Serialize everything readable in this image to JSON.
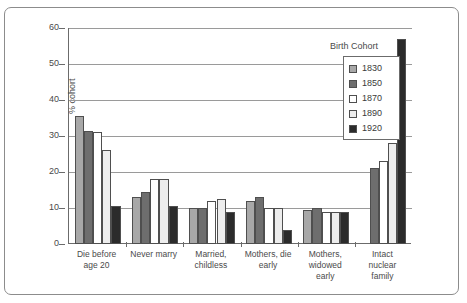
{
  "chart_data": {
    "type": "bar",
    "title": "",
    "xlabel": "",
    "ylabel": "% cohort",
    "ylim": [
      0,
      60
    ],
    "ytick_values": [
      0,
      10,
      20,
      30,
      40,
      50,
      60
    ],
    "ytick_labels": [
      "0",
      "10",
      "20",
      "30",
      "40",
      "50",
      "60"
    ],
    "grid": true,
    "legend_title": "Birth Cohort",
    "legend_position": "top-right-inside",
    "categories": [
      "Die before age 20",
      "Never marry",
      "Married, childless",
      "Mothers, die early",
      "Mothers, widowed early",
      "Intact nuclear family"
    ],
    "category_lines": [
      [
        "Die before",
        "age 20"
      ],
      [
        "Never marry"
      ],
      [
        "Married,",
        "childless"
      ],
      [
        "Mothers, die",
        "early"
      ],
      [
        "Mothers,",
        "widowed",
        "early"
      ],
      [
        "Intact",
        "nuclear",
        "family"
      ]
    ],
    "series": [
      {
        "name": "1830",
        "color": "#a8a8a8",
        "values": [
          35.5,
          13.0,
          10.0,
          12.0,
          9.5,
          null
        ]
      },
      {
        "name": "1850",
        "color": "#6e6e6e",
        "values": [
          31.5,
          14.5,
          10.0,
          13.0,
          10.0,
          21.0
        ]
      },
      {
        "name": "1870",
        "color": "#ffffff",
        "values": [
          31.0,
          18.0,
          12.0,
          10.0,
          9.0,
          23.0
        ]
      },
      {
        "name": "1890",
        "color": "#ededed",
        "values": [
          26.0,
          18.0,
          12.5,
          10.0,
          9.0,
          28.0
        ]
      },
      {
        "name": "1920",
        "color": "#2b2b2b",
        "values": [
          10.5,
          10.5,
          9.0,
          4.0,
          9.0,
          57.0
        ]
      }
    ]
  },
  "legend": {
    "title": "Birth Cohort",
    "entries": [
      {
        "label": "1830",
        "color": "#a8a8a8"
      },
      {
        "label": "1850",
        "color": "#6e6e6e"
      },
      {
        "label": "1870",
        "color": "#ffffff"
      },
      {
        "label": "1890",
        "color": "#ededed"
      },
      {
        "label": "1920",
        "color": "#2b2b2b"
      }
    ]
  },
  "axis": {
    "y_title": "% cohort"
  }
}
